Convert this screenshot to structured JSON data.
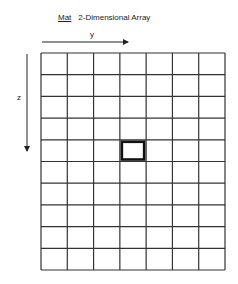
{
  "title": {
    "name": "Mat",
    "description": "2-Dimensional Array"
  },
  "axes": {
    "horizontal_label": "y",
    "vertical_label": "z"
  },
  "grid": {
    "rows": 10,
    "columns": 7,
    "highlighted_cell": {
      "row": 5,
      "column": 4
    }
  },
  "colors": {
    "line": "#333333",
    "highlight": "#111111",
    "background": "#ffffff"
  }
}
